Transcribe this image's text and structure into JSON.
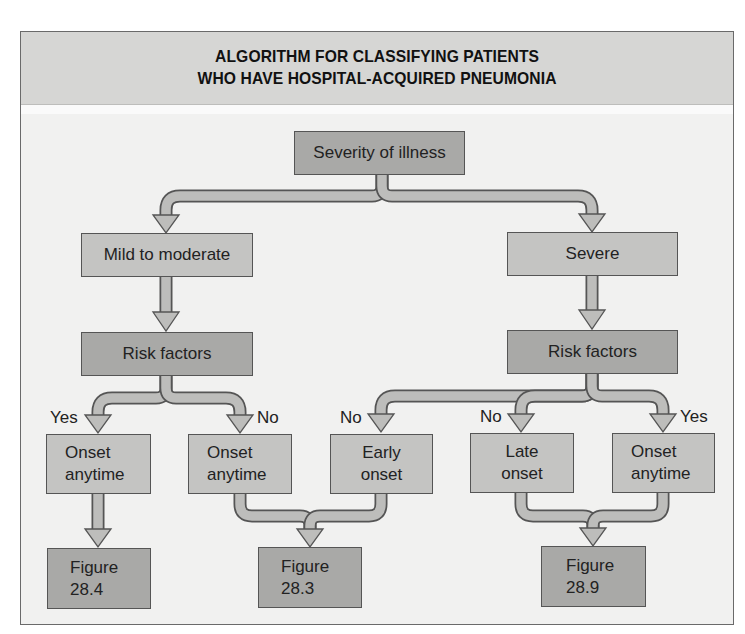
{
  "title": {
    "line1": "ALGORITHM FOR CLASSIFYING PATIENTS",
    "line2": "WHO HAVE HOSPITAL-ACQUIRED PNEUMONIA"
  },
  "colors": {
    "header_band": "#d6d6d4",
    "panel_background": "#f1f1f0",
    "light_box": "#c4c4c2",
    "dark_box": "#a9a9a7",
    "arrow_fill": "#bdbdbb",
    "outline": "#555555"
  },
  "nodes": {
    "root": {
      "label": "Severity of illness"
    },
    "mild": {
      "label": "Mild to moderate"
    },
    "severe": {
      "label": "Severe"
    },
    "risk_left": {
      "label": "Risk factors"
    },
    "risk_right": {
      "label": "Risk factors"
    },
    "leaf1": {
      "line1": "Onset",
      "line2": "anytime"
    },
    "leaf2": {
      "line1": "Onset",
      "line2": "anytime"
    },
    "leaf3": {
      "line1": "Early",
      "line2": "onset"
    },
    "leaf4": {
      "line1": "Late",
      "line2": "onset"
    },
    "leaf5": {
      "line1": "Onset",
      "line2": "anytime"
    },
    "fig1": {
      "line1": "Figure",
      "line2": "28.4"
    },
    "fig2": {
      "line1": "Figure",
      "line2": "28.3"
    },
    "fig3": {
      "line1": "Figure",
      "line2": "28.9"
    }
  },
  "edge_labels": {
    "left_yes": "Yes",
    "left_no": "No",
    "right_no_early": "No",
    "right_no_late": "No",
    "right_yes": "Yes"
  },
  "edges": [
    {
      "from": "Severity of illness",
      "to": "Mild to moderate"
    },
    {
      "from": "Severity of illness",
      "to": "Severe"
    },
    {
      "from": "Mild to moderate",
      "to": "Risk factors (left)"
    },
    {
      "from": "Severe",
      "to": "Risk factors (right)"
    },
    {
      "from": "Risk factors (left)",
      "to": "Onset anytime (1)",
      "label": "Yes"
    },
    {
      "from": "Risk factors (left)",
      "to": "Onset anytime (2)",
      "label": "No"
    },
    {
      "from": "Risk factors (right)",
      "to": "Early onset",
      "label": "No"
    },
    {
      "from": "Risk factors (right)",
      "to": "Late onset",
      "label": "No"
    },
    {
      "from": "Risk factors (right)",
      "to": "Onset anytime (3)",
      "label": "Yes"
    },
    {
      "from": "Onset anytime (1)",
      "to": "Figure 28.4"
    },
    {
      "from": "Onset anytime (2)",
      "to": "Figure 28.3"
    },
    {
      "from": "Early onset",
      "to": "Figure 28.3"
    },
    {
      "from": "Late onset",
      "to": "Figure 28.9"
    },
    {
      "from": "Onset anytime (3)",
      "to": "Figure 28.9"
    }
  ]
}
